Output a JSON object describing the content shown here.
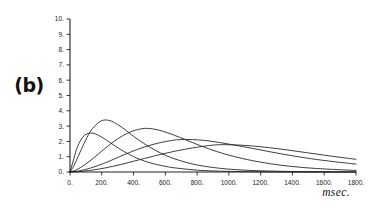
{
  "figure": {
    "panel_label": "(b)"
  },
  "chart_data": {
    "type": "line",
    "title": "",
    "subtitle": "",
    "xlabel": "msec.",
    "ylabel": "",
    "xlim": [
      0,
      1800
    ],
    "ylim": [
      0,
      10
    ],
    "grid": false,
    "legend": "none",
    "x_ticks": [
      0,
      200,
      400,
      600,
      800,
      1000,
      1200,
      1400,
      1600,
      1800
    ],
    "x_tick_labels": [
      "0.",
      "200.",
      "400.",
      "600.",
      "800.",
      "1000.",
      "1200.",
      "1400.",
      "1600.",
      "1800."
    ],
    "y_ticks": [
      0,
      1,
      2,
      3,
      4,
      5,
      6,
      7,
      8,
      9,
      10
    ],
    "y_tick_labels": [
      "0.",
      "1.",
      "2.",
      "3.",
      "4.",
      "5.",
      "6.",
      "7.",
      "8.",
      "9.",
      "10."
    ],
    "series": [
      {
        "name": "curve-1",
        "color": "#1c1c1c",
        "peak_x": 130,
        "peak_y": 2.55,
        "x": [
          0,
          20,
          40,
          60,
          80,
          100,
          130,
          160,
          200,
          240,
          290,
          340,
          400,
          470,
          540,
          620,
          700,
          800,
          900,
          1050,
          1200,
          1400,
          1600,
          1800
        ],
        "values": [
          0.0,
          0.72,
          1.44,
          1.95,
          2.28,
          2.46,
          2.55,
          2.49,
          2.28,
          2.01,
          1.66,
          1.34,
          1.0,
          0.71,
          0.5,
          0.33,
          0.22,
          0.12,
          0.07,
          0.03,
          0.01,
          0.0,
          0.0,
          0.0
        ]
      },
      {
        "name": "curve-2",
        "color": "#1c1c1c",
        "peak_x": 225,
        "peak_y": 3.4,
        "x": [
          0,
          25,
          55,
          90,
          125,
          160,
          195,
          225,
          260,
          300,
          345,
          400,
          460,
          530,
          610,
          700,
          800,
          920,
          1050,
          1200,
          1400,
          1600,
          1800
        ],
        "values": [
          0.0,
          0.42,
          1.1,
          1.9,
          2.6,
          3.05,
          3.33,
          3.4,
          3.33,
          3.1,
          2.78,
          2.33,
          1.9,
          1.46,
          1.05,
          0.72,
          0.46,
          0.27,
          0.15,
          0.08,
          0.03,
          0.01,
          0.0
        ]
      },
      {
        "name": "curve-3",
        "color": "#1c1c1c",
        "peak_x": 470,
        "peak_y": 2.85,
        "x": [
          0,
          40,
          90,
          150,
          210,
          270,
          330,
          390,
          430,
          470,
          520,
          580,
          650,
          730,
          820,
          920,
          1030,
          1150,
          1300,
          1450,
          1600,
          1800
        ],
        "values": [
          0.0,
          0.14,
          0.45,
          0.93,
          1.45,
          1.95,
          2.36,
          2.66,
          2.78,
          2.85,
          2.82,
          2.68,
          2.43,
          2.1,
          1.72,
          1.35,
          1.02,
          0.74,
          0.48,
          0.31,
          0.2,
          0.1
        ]
      },
      {
        "name": "curve-4",
        "color": "#1c1c1c",
        "peak_x": 700,
        "peak_y": 2.12,
        "x": [
          0,
          60,
          130,
          210,
          290,
          380,
          470,
          560,
          640,
          700,
          770,
          850,
          940,
          1040,
          1150,
          1270,
          1400,
          1550,
          1700,
          1800
        ],
        "values": [
          0.0,
          0.08,
          0.26,
          0.55,
          0.9,
          1.3,
          1.64,
          1.9,
          2.06,
          2.12,
          2.12,
          2.06,
          1.93,
          1.75,
          1.54,
          1.3,
          1.06,
          0.82,
          0.63,
          0.52
        ]
      },
      {
        "name": "curve-5",
        "color": "#1c1c1c",
        "peak_x": 930,
        "peak_y": 1.78,
        "x": [
          0,
          80,
          170,
          270,
          370,
          470,
          570,
          670,
          770,
          860,
          930,
          1010,
          1100,
          1200,
          1310,
          1430,
          1560,
          1700,
          1800
        ],
        "values": [
          0.0,
          0.05,
          0.17,
          0.37,
          0.62,
          0.89,
          1.15,
          1.38,
          1.57,
          1.71,
          1.78,
          1.78,
          1.74,
          1.65,
          1.52,
          1.35,
          1.16,
          0.96,
          0.83
        ]
      }
    ]
  }
}
